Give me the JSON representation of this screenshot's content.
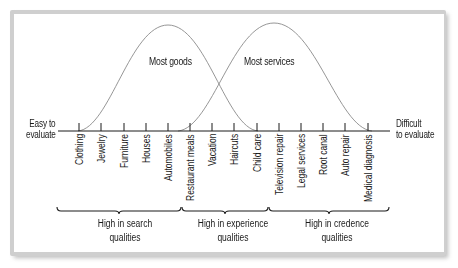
{
  "diagram": {
    "axis": {
      "left_label_line1": "Easy to",
      "left_label_line2": "evaluate",
      "right_label_line1": "Difficult",
      "right_label_line2": "to evaluate"
    },
    "curves": [
      {
        "label": "Most goods",
        "peak_x": 168
      },
      {
        "label": "Most services",
        "peak_x": 273
      }
    ],
    "items": [
      "Clothing",
      "Jewelry",
      "Furniture",
      "Houses",
      "Automobiles",
      "Restaurant meals",
      "Vacation",
      "Haircuts",
      "Child care",
      "Television repair",
      "Legal services",
      "Root canal",
      "Auto repair",
      "Medical diagnosis"
    ],
    "groups": [
      {
        "line1": "High in search",
        "line2": "qualities"
      },
      {
        "line1": "High in experience",
        "line2": "qualities"
      },
      {
        "line1": "High in credence",
        "line2": "qualities"
      }
    ],
    "colors": {
      "frame": "#cfcfcf",
      "curve": "#8a8a8a",
      "axis": "#1a1a1a"
    }
  }
}
